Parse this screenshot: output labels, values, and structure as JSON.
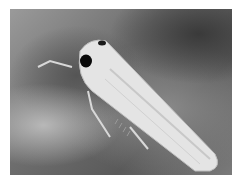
{
  "image": {
    "subject": "leafhopper insect on leaf surface",
    "style": "grayscale photograph",
    "colors": {
      "background_dark": "#3a3a3a",
      "background_mid": "#7a7a7a",
      "body": "#e6e6e6",
      "eye": "#0a0a0a"
    }
  }
}
